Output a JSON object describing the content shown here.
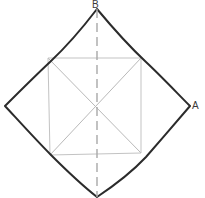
{
  "figure": {
    "title": "",
    "background_color": "#ffffff",
    "outline_color": "#2b2b2b",
    "inner_line_color": "#b9b9b9",
    "dashed_line_color": "#a8a8a8",
    "label_color": "#3a3a3a",
    "labels": [
      {
        "id": "B",
        "text": "B",
        "position": "top-vertex",
        "x": 97,
        "y": 9
      },
      {
        "id": "A",
        "text": "A",
        "position": "right-vertex",
        "x": 190,
        "y": 106
      }
    ],
    "shapes": {
      "outer_quadrilateral": {
        "name": "hand-drawn-diamond",
        "vertices": [
          {
            "label": "B",
            "x": 97,
            "y": 9
          },
          {
            "label": "A",
            "x": 190,
            "y": 106
          },
          {
            "label": "bottom",
            "x": 97,
            "y": 197
          },
          {
            "label": "left",
            "x": 5,
            "y": 106
          }
        ],
        "stroke_width": 2,
        "style": "solid"
      },
      "inner_quadrilateral": {
        "name": "inscribed-square",
        "vertices": [
          {
            "label": "upper-left",
            "x": 48,
            "y": 58
          },
          {
            "label": "upper-right",
            "x": 141,
            "y": 58
          },
          {
            "label": "lower-right",
            "x": 141,
            "y": 153
          },
          {
            "label": "lower-left",
            "x": 50,
            "y": 155
          }
        ],
        "stroke_width": 1,
        "style": "solid-light"
      },
      "diagonals": [
        {
          "name": "diagonal-ul-to-lr",
          "x1": 48,
          "y1": 58,
          "x2": 141,
          "y2": 153
        },
        {
          "name": "diagonal-ur-to-ll",
          "x1": 141,
          "y1": 58,
          "x2": 50,
          "y2": 155
        }
      ],
      "axis_of_symmetry": {
        "name": "vertical-dashed-axis",
        "x1": 97,
        "y1": 9,
        "x2": 97,
        "y2": 197,
        "style": "dashed",
        "dash_pattern": "9 5",
        "stroke_width": 1
      },
      "center_point": {
        "x": 97,
        "y": 106
      }
    }
  }
}
